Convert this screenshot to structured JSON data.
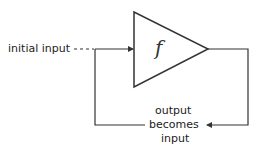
{
  "diagram": {
    "function_label": "f",
    "initial_input_label": "initial input",
    "feedback_label": {
      "line1": "output",
      "line2": "becomes",
      "line3": "input"
    },
    "colors": {
      "stroke": "#333333",
      "text": "#222222",
      "background": "#ffffff"
    }
  }
}
